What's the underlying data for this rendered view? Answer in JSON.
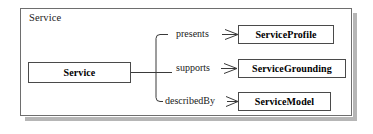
{
  "diagram": {
    "type": "uml-class-relationship",
    "container": {
      "label": "Service"
    },
    "nodes": [
      {
        "id": "service",
        "label": "Service",
        "role": "source"
      },
      {
        "id": "profile",
        "label": "ServiceProfile",
        "role": "target"
      },
      {
        "id": "grounding",
        "label": "ServiceGrounding",
        "role": "target"
      },
      {
        "id": "model",
        "label": "ServiceModel",
        "role": "target"
      }
    ],
    "edges": [
      {
        "from": "service",
        "to": "profile",
        "label": "presents",
        "arrow": "open"
      },
      {
        "from": "service",
        "to": "grounding",
        "label": "supports",
        "arrow": "open"
      },
      {
        "from": "service",
        "to": "model",
        "label": "describedBy",
        "arrow": "open"
      }
    ],
    "colors": {
      "frame_border": "#6e6e6e",
      "node_border": "#4a4a4a",
      "connector": "#3a3a3a",
      "shadow": "#b6b6b6",
      "background": "#ffffff",
      "text": "#000000"
    }
  }
}
